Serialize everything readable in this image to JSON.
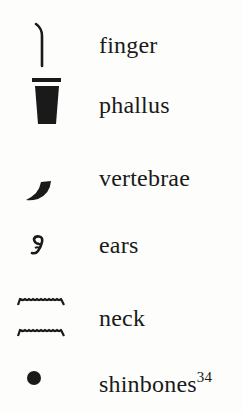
{
  "entries": [
    {
      "glyph": "finger-hieroglyph",
      "label": "finger"
    },
    {
      "glyph": "phallus-hieroglyph",
      "label": "phallus"
    },
    {
      "glyph": "vertebrae-hieroglyph",
      "label": "vertebrae"
    },
    {
      "glyph": "ears-hieroglyph",
      "label": "ears"
    },
    {
      "glyph": "neck-hieroglyph",
      "label": "neck"
    },
    {
      "glyph": "shinbones-hieroglyph",
      "label": "shinbones",
      "footnote": "34"
    }
  ],
  "colors": {
    "ink": "#1a1a1a",
    "paper": "#fdfdfb"
  }
}
